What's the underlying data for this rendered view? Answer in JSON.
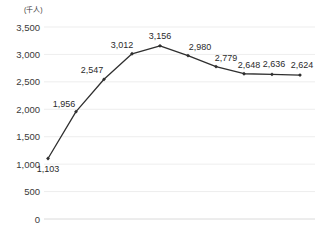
{
  "chart_data": {
    "type": "line",
    "title": "",
    "subtitle": "",
    "xlabel": "",
    "ylabel": "",
    "unit_label": "(千人)",
    "grid": true,
    "legend": false,
    "ylim": [
      0,
      3500
    ],
    "ytick_step": 500,
    "ytick_labels": [
      "3,500",
      "3,000",
      "2,500",
      "2,000",
      "1,500",
      "1,000",
      "500",
      "0"
    ],
    "ytick_values": [
      3500,
      3000,
      2500,
      2000,
      1500,
      1000,
      500,
      0
    ],
    "categories": [
      "1",
      "2",
      "3",
      "4",
      "5",
      "6",
      "7",
      "8",
      "9",
      "10"
    ],
    "values": [
      1103,
      1956,
      2547,
      3012,
      3156,
      2980,
      2779,
      2648,
      2636,
      2624
    ],
    "point_labels": [
      "1,103",
      "1,956",
      "2,547",
      "3,012",
      "3,156",
      "2,980",
      "2,779",
      "2,648",
      "2,636",
      "2,624"
    ],
    "series": [
      {
        "name": "series-1",
        "color": "#2f2f2f",
        "values": [
          1103,
          1956,
          2547,
          3012,
          3156,
          2980,
          2779,
          2648,
          2636,
          2624
        ]
      }
    ]
  },
  "colors": {
    "background": "#ffffff",
    "line": "#2f2f2f",
    "marker": "#2f2f2f",
    "grid": "#e9e9e9",
    "axis": "#d6d6d6",
    "text": "#3a3a3a"
  }
}
